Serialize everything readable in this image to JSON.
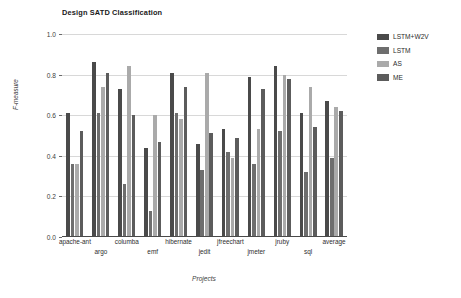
{
  "chart_data": {
    "type": "bar",
    "title": "Design SATD Classification",
    "xlabel": "Projects",
    "ylabel": "F-measure",
    "ylim": [
      0.0,
      1.0
    ],
    "yticks": [
      "0.0",
      "0.2",
      "0.4",
      "0.6",
      "0.8",
      "1.0"
    ],
    "ytick_values": [
      0.0,
      0.2,
      0.4,
      0.6,
      0.8,
      1.0
    ],
    "grid": true,
    "legend_position": "right",
    "categories": [
      "apache-ant",
      "argo",
      "columba",
      "emf",
      "hibernate",
      "jedit",
      "jfreechart",
      "jmeter",
      "jruby",
      "sql",
      "average"
    ],
    "series": [
      {
        "name": "LSTM+W2V",
        "color": "#4a4a4a",
        "values": [
          0.61,
          0.86,
          0.73,
          0.44,
          0.81,
          0.46,
          0.53,
          0.79,
          0.84,
          0.61,
          0.67
        ]
      },
      {
        "name": "LSTM",
        "color": "#6e6e6e",
        "values": [
          0.36,
          0.61,
          0.26,
          0.13,
          0.61,
          0.33,
          0.42,
          0.36,
          0.52,
          0.32,
          0.39
        ]
      },
      {
        "name": "AS",
        "color": "#aaaaaa",
        "values": [
          0.36,
          0.74,
          0.84,
          0.6,
          0.58,
          0.81,
          0.39,
          0.53,
          0.8,
          0.74,
          0.64
        ]
      },
      {
        "name": "ME",
        "color": "#5c5c5c",
        "values": [
          0.52,
          0.81,
          0.6,
          0.47,
          0.74,
          0.51,
          0.49,
          0.73,
          0.78,
          0.54,
          0.62
        ]
      }
    ]
  }
}
